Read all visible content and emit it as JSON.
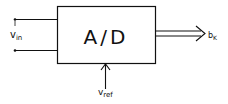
{
  "diagram": {
    "block_label": "A/D",
    "input": {
      "label_main": "v",
      "label_sub": "in"
    },
    "output": {
      "label_main": "b",
      "label_sub": "K"
    },
    "reference": {
      "label_main": "v",
      "label_sub": "ref"
    },
    "colors": {
      "stroke": "#111111",
      "background": "#ffffff"
    }
  }
}
